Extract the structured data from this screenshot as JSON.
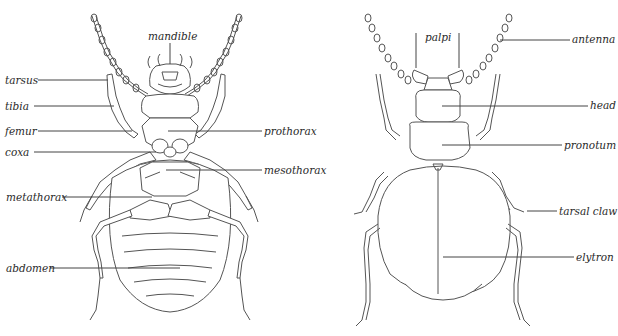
{
  "diagram": {
    "title": "",
    "views": [
      {
        "id": "ventral",
        "labels": {
          "mandible": "mandible",
          "tarsus": "tarsus",
          "tibia": "tibia",
          "femur": "femur",
          "coxa": "coxa",
          "prothorax": "prothorax",
          "mesothorax": "mesothorax",
          "metathorax": "metathorax",
          "abdomen": "abdomen"
        }
      },
      {
        "id": "dorsal",
        "labels": {
          "palpi": "palpi",
          "antenna": "antenna",
          "head": "head",
          "pronotum": "pronotum",
          "tarsal_claw": "tarsal claw",
          "elytron": "elytron"
        }
      }
    ],
    "colors": {
      "line": "#555555",
      "text": "#2a2a2a",
      "background": "#ffffff"
    }
  }
}
